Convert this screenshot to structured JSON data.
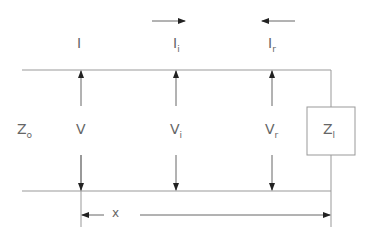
{
  "diagram": {
    "type": "transmission-line",
    "currents": [
      {
        "label": "I",
        "sub": ""
      },
      {
        "label": "I",
        "sub": "i"
      },
      {
        "label": "I",
        "sub": "r"
      }
    ],
    "voltages": [
      {
        "label": "V",
        "sub": ""
      },
      {
        "label": "V",
        "sub": "i"
      },
      {
        "label": "V",
        "sub": "r"
      }
    ],
    "source_impedance": {
      "label": "Z",
      "sub": "o"
    },
    "load_impedance": {
      "label": "Z",
      "sub": "l"
    },
    "distance_label": "x",
    "line_color": "#888888"
  }
}
